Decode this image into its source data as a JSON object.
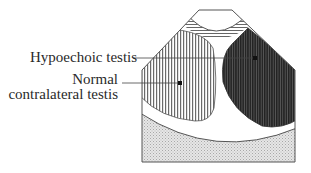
{
  "diagram": {
    "type": "ultrasound schematic",
    "labels": {
      "hypoechoic": "Hypoechoic testis",
      "normal_line1": "Normal",
      "normal_line2": "contralateral testis"
    },
    "colors": {
      "outline": "#555555",
      "hypoechoic_fill": "#3a3a3a",
      "normal_fill": "#9a9a9a",
      "stipple": "#d4d4d4",
      "text": "#2a2a2a"
    }
  }
}
